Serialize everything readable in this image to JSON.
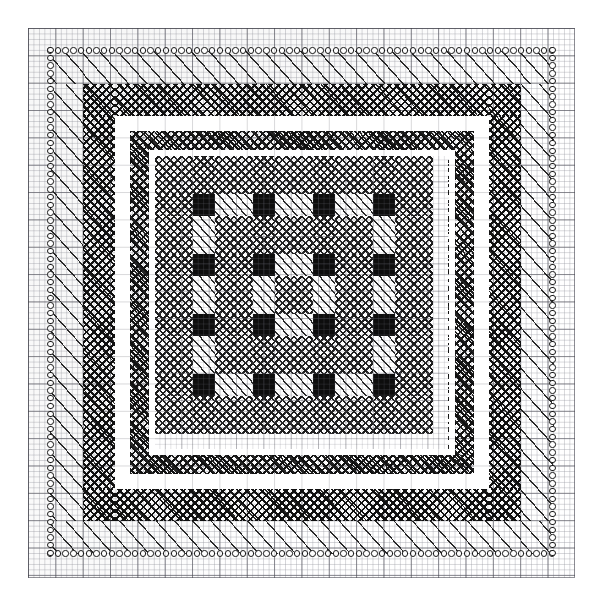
{
  "document": {
    "title": "Hand-drawn quilt block plaid design on graph paper",
    "medium": "graph-paper-drawing",
    "width_px": 602,
    "height_px": 605,
    "background_color": "#ffffff"
  },
  "graph_paper": {
    "name": "graph-paper-sheet",
    "left_px": 28,
    "top_px": 28,
    "width_px": 547,
    "height_px": 550,
    "minor_cell_px": 5.47,
    "major_cell_px": 27.35,
    "minor_line_color": "#96989f",
    "major_line_color": "#6e6e78",
    "paper_color": "#ffffff"
  },
  "bands": [
    {
      "index": 0,
      "name": "circle-border",
      "pattern": "circles",
      "description": "single row of small open circles forming the outermost square frame",
      "stroke_color": "#1a1a1a",
      "fill_color": "#ffffff",
      "circle_diameter_px": 6.4,
      "thickness_px": 9,
      "left_px": 38,
      "top_px": 38,
      "width_px": 527,
      "height_px": 528
    },
    {
      "index": 1,
      "name": "sparse-diagonal-band",
      "pattern": "diagonal-hatch-wide",
      "description": "widely spaced single diagonal strokes running lower-left to upper-right",
      "stroke_color": "#2a2a2a",
      "spacing_px": 13.6,
      "angle_deg": 48,
      "thickness_px": 33,
      "left_px": 50,
      "top_px": 51,
      "width_px": 504,
      "height_px": 503
    },
    {
      "index": 2,
      "name": "cross-hatch-band",
      "pattern": "cross-hatch-dense",
      "description": "dark dense cross-hatched frame, the heaviest value in the design",
      "stroke_color": "#111111",
      "spacing_px": 5.6,
      "angle_deg": 45,
      "thickness_px": 32,
      "left_px": 83,
      "top_px": 84,
      "width_px": 438,
      "height_px": 437
    },
    {
      "index": 3,
      "name": "white-gap-outer",
      "pattern": "blank",
      "description": "plain unworked white frame separating cross-hatch from inner hatch",
      "fill_color": "#ffffff",
      "thickness_px": 15,
      "left_px": 115,
      "top_px": 116,
      "width_px": 374,
      "height_px": 373
    },
    {
      "index": 4,
      "name": "dense-diagonal-band",
      "pattern": "diagonal-hatch-dense",
      "description": "narrowly spaced diagonal hatch frame just outside the centre field",
      "stroke_color": "#222222",
      "spacing_px": 6.6,
      "angle_deg": 48,
      "thickness_px": 19,
      "left_px": 130,
      "top_px": 131,
      "width_px": 344,
      "height_px": 343
    },
    {
      "index": 5,
      "name": "white-gap-inner",
      "pattern": "blank",
      "description": "thin white frame between the dense hatch band and the plaid field",
      "fill_color": "#ffffff",
      "thickness_px": 6,
      "left_px": 149,
      "top_px": 150,
      "width_px": 306,
      "height_px": 305
    }
  ],
  "center_field": {
    "name": "plaid-grid",
    "description": "nine by nine gingham / plaid field; wide stripes are cross-hatched, narrow stripes are diagonally hatched, and the crossings of two narrow stripes are filled solid black",
    "left_px": 155,
    "top_px": 156,
    "width_px": 293,
    "height_px": 293,
    "columns": 9,
    "rows": 9,
    "column_widths_px": [
      38,
      22,
      38,
      22,
      38,
      22,
      38,
      22,
      38
    ],
    "row_heights_px": [
      38,
      22,
      38,
      22,
      38,
      22,
      38,
      22,
      38
    ],
    "stripe_kinds": [
      "cross",
      "diag",
      "cross",
      "diag",
      "cross",
      "diag",
      "cross",
      "diag",
      "cross"
    ],
    "legend": [
      {
        "key": "cross",
        "label": "cross-hatch (mid dark)",
        "color": "#1c1c1c"
      },
      {
        "key": "crossdiag",
        "label": "cross-hatch over diagonal (mid)",
        "color": "#1a1a1a"
      },
      {
        "key": "diagv",
        "label": "diagonal hatch",
        "color": "#262626"
      },
      {
        "key": "black",
        "label": "solid black",
        "color": "#0d0d0d"
      },
      {
        "key": "white",
        "label": "unworked white",
        "color": "#ffffff"
      }
    ],
    "cells": [
      [
        "cross",
        "crossdiag",
        "cross",
        "crossdiag",
        "cross",
        "crossdiag",
        "cross",
        "crossdiag",
        "cross"
      ],
      [
        "crossdiag",
        "black",
        "diagv",
        "black",
        "diagv",
        "black",
        "diagv",
        "black",
        "crossdiag"
      ],
      [
        "cross",
        "diagv",
        "cross",
        "crossdiag",
        "cross",
        "crossdiag",
        "cross",
        "diagv",
        "cross"
      ],
      [
        "crossdiag",
        "black",
        "crossdiag",
        "black",
        "diagv",
        "black",
        "crossdiag",
        "black",
        "crossdiag"
      ],
      [
        "cross",
        "diagv",
        "cross",
        "diagv",
        "cross",
        "diagv",
        "cross",
        "diagv",
        "cross"
      ],
      [
        "crossdiag",
        "black",
        "crossdiag",
        "black",
        "diagv",
        "black",
        "crossdiag",
        "black",
        "crossdiag"
      ],
      [
        "cross",
        "diagv",
        "cross",
        "crossdiag",
        "cross",
        "crossdiag",
        "cross",
        "diagv",
        "cross"
      ],
      [
        "crossdiag",
        "black",
        "diagv",
        "black",
        "diagv",
        "black",
        "diagv",
        "black",
        "crossdiag"
      ],
      [
        "cross",
        "crossdiag",
        "cross",
        "crossdiag",
        "cross",
        "crossdiag",
        "cross",
        "crossdiag",
        "cross"
      ]
    ],
    "black_square_grid": {
      "rows": 4,
      "columns": 4,
      "description": "sixteen solid black squares arranged four by four at the narrow-stripe crossings"
    }
  }
}
